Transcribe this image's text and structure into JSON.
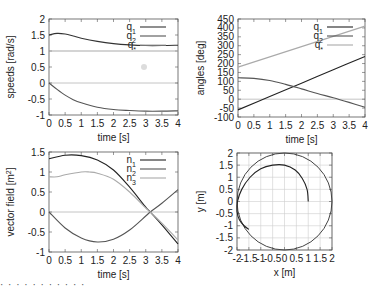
{
  "chart_data": [
    {
      "type": "line",
      "title": "",
      "xlabel": "time [s]",
      "ylabel": "speeds [rad/s]",
      "xlim": [
        0,
        4
      ],
      "ylim": [
        -1,
        2
      ],
      "xticks": [
        "0",
        "0.5",
        "1",
        "1.5",
        "2",
        "2.5",
        "3",
        "3.5",
        "4"
      ],
      "yticks": [
        "2",
        "1.5",
        "1",
        "0.5",
        "0",
        "-0.5",
        "-1"
      ],
      "legend_position": "top-right",
      "series": [
        {
          "name": "q1",
          "label_base": "q",
          "label_sub": "1",
          "color": "#333333",
          "x": [
            0,
            0.25,
            0.5,
            0.75,
            1,
            1.5,
            2,
            2.5,
            3,
            3.5,
            4
          ],
          "y": [
            1.5,
            1.55,
            1.53,
            1.47,
            1.4,
            1.3,
            1.23,
            1.19,
            1.17,
            1.17,
            1.18
          ]
        },
        {
          "name": "q2",
          "label_base": "q",
          "label_sub": "2",
          "color": "#555555",
          "x": [
            0,
            0.25,
            0.5,
            0.75,
            1,
            1.5,
            2,
            2.5,
            3,
            3.5,
            4
          ],
          "y": [
            0,
            -0.2,
            -0.38,
            -0.52,
            -0.62,
            -0.76,
            -0.83,
            -0.86,
            -0.88,
            -0.88,
            -0.87
          ]
        },
        {
          "name": "q*",
          "label_base": "q",
          "label_sub": "*",
          "color": "#aaaaaa",
          "x": [
            0,
            4
          ],
          "y": [
            1,
            1
          ]
        }
      ],
      "zero_line": true
    },
    {
      "type": "line",
      "title": "",
      "xlabel": "time [s]",
      "ylabel": "angles [deg]",
      "xlim": [
        0,
        4
      ],
      "ylim": [
        -100,
        450
      ],
      "xticks": [
        "0",
        "0.5",
        "1",
        "1.5",
        "2",
        "2.5",
        "3",
        "3.5",
        "4"
      ],
      "yticks": [
        "450",
        "400",
        "350",
        "300",
        "250",
        "200",
        "150",
        "100",
        "50",
        "0",
        "-50",
        "-100"
      ],
      "legend_position": "top-right",
      "series": [
        {
          "name": "q1",
          "label_base": "q",
          "label_sub": "1",
          "color": "#222222",
          "x": [
            0,
            1,
            2,
            3,
            4
          ],
          "y": [
            -60,
            15,
            90,
            165,
            240
          ]
        },
        {
          "name": "q2",
          "label_base": "q",
          "label_sub": "2",
          "color": "#555555",
          "x": [
            0,
            0.5,
            1,
            1.5,
            2,
            2.5,
            3,
            3.5,
            4
          ],
          "y": [
            120,
            117,
            105,
            83,
            58,
            32,
            8,
            -18,
            -45
          ]
        },
        {
          "name": "q*",
          "label_base": "q",
          "label_sub": "*",
          "color": "#aaaaaa",
          "x": [
            0,
            4
          ],
          "y": [
            180,
            410
          ]
        }
      ],
      "zero_line": true
    },
    {
      "type": "line",
      "title": "",
      "xlabel": "time [s]",
      "ylabel": "vector field [m",
      "ylabel_sup": "2",
      "ylabel_end": "]",
      "xlim": [
        0,
        4
      ],
      "ylim": [
        -1,
        1.5
      ],
      "xticks": [
        "0",
        "0.5",
        "1",
        "1.5",
        "2",
        "2.5",
        "3",
        "3.5",
        "4"
      ],
      "yticks": [
        "1.5",
        "1",
        "0.5",
        "0",
        "-0.5",
        "-1"
      ],
      "legend_position": "top-right",
      "series": [
        {
          "name": "n1",
          "label_base": "n",
          "label_sub": "1",
          "color": "#222222",
          "x": [
            0,
            0.5,
            1,
            1.5,
            2,
            2.5,
            3,
            3.14,
            3.5,
            4
          ],
          "y": [
            1.33,
            1.42,
            1.41,
            1.3,
            1.05,
            0.62,
            0.12,
            0,
            -0.32,
            -0.8
          ]
        },
        {
          "name": "n2",
          "label_base": "n",
          "label_sub": "2",
          "color": "#555555",
          "x": [
            0,
            0.5,
            1,
            1.5,
            2,
            2.5,
            3,
            3.14,
            3.5,
            4
          ],
          "y": [
            0,
            -0.4,
            -0.65,
            -0.75,
            -0.68,
            -0.45,
            -0.1,
            0,
            0.22,
            0.56
          ]
        },
        {
          "name": "n3",
          "label_base": "n",
          "label_sub": "3",
          "color": "#aaaaaa",
          "x": [
            0,
            0.25,
            0.5,
            1,
            1.25,
            1.5,
            2,
            2.5,
            3,
            3.14,
            3.5,
            4
          ],
          "y": [
            0.88,
            0.88,
            0.93,
            1.0,
            1.0,
            0.97,
            0.82,
            0.5,
            0.1,
            0,
            -0.28,
            -0.7
          ]
        }
      ],
      "zero_line": true
    },
    {
      "type": "line",
      "title": "",
      "xlabel": "x [m]",
      "ylabel": "y [m]",
      "xlim": [
        -2,
        2
      ],
      "ylim": [
        -2,
        2
      ],
      "xticks": [
        "-2",
        "-1.5",
        "-1",
        "-0.5",
        "0",
        "0.5",
        "1",
        "1.5",
        "2"
      ],
      "yticks": [
        "2",
        "1.5",
        "1",
        "0.5",
        "0",
        "-0.5",
        "-1",
        "-1.5",
        "-2"
      ],
      "grid": true,
      "series": [
        {
          "name": "reference circle",
          "shape": "circle",
          "center": [
            0,
            0
          ],
          "radius": 2,
          "color": "#444444"
        },
        {
          "name": "trajectory",
          "color": "#222222",
          "x": [
            1.0,
            0.95,
            0.75,
            0.45,
            0.0,
            -0.5,
            -1.0,
            -1.45,
            -1.8,
            -1.98,
            -2.0,
            -1.9,
            -1.7,
            -1.5
          ],
          "y": [
            0.0,
            0.5,
            0.95,
            1.3,
            1.5,
            1.5,
            1.35,
            1.0,
            0.5,
            0.0,
            -0.4,
            -0.75,
            -1.0,
            -1.15
          ]
        }
      ]
    }
  ],
  "panels": {
    "top_left": {
      "ylabel": "speeds [rad/s]",
      "xlabel": "time [s]",
      "legend": [
        {
          "base": "q",
          "sub": "1"
        },
        {
          "base": "q",
          "sub": "2"
        },
        {
          "base": "q",
          "sub": "*"
        }
      ]
    },
    "top_right": {
      "ylabel": "angles [deg]",
      "xlabel": "time [s]",
      "legend": [
        {
          "base": "q",
          "sub": "1"
        },
        {
          "base": "q",
          "sub": "2"
        },
        {
          "base": "q",
          "sub": "*"
        }
      ]
    },
    "bottom_left": {
      "ylabel_main": "vector field [m",
      "ylabel_sup": "2",
      "ylabel_end": "]",
      "xlabel": "time [s]",
      "legend": [
        {
          "base": "n",
          "sub": "1"
        },
        {
          "base": "n",
          "sub": "2"
        },
        {
          "base": "n",
          "sub": "3"
        }
      ]
    },
    "bottom_right": {
      "ylabel": "y [m]",
      "xlabel": "x [m]"
    }
  },
  "caption_fragment": "· · ·   · ·   ·   ·   · ·   ·   ·"
}
